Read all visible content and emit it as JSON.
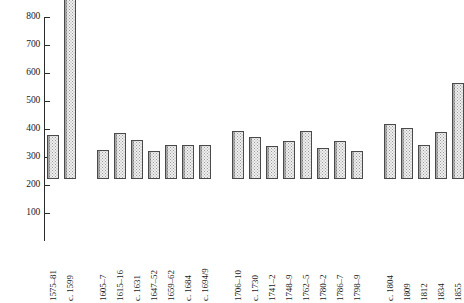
{
  "chart_data": {
    "type": "bar",
    "title": "",
    "subtitle": "",
    "xlabel": "",
    "ylabel": "",
    "ylim": [
      0,
      800
    ],
    "yticks": [
      100,
      200,
      300,
      400,
      500,
      600,
      700,
      800
    ],
    "ytick_labels": [
      "100",
      "200",
      "300",
      "400",
      "500",
      "600",
      "700",
      "800"
    ],
    "grid": false,
    "legend": null,
    "categories": [
      "1575–81",
      "c. 1599",
      "1605–7",
      "1615–16",
      "c. 1631",
      "1647–52",
      "1659–62",
      "c. 1684",
      "c. 1694/9",
      "1706–10",
      "c. 1730",
      "1741–2",
      "1748–9",
      "1762–5",
      "1780–2",
      "1786–7",
      "1798–9",
      "c. 1804",
      "1809",
      "1812",
      "1834",
      "1855"
    ],
    "values": [
      157,
      785,
      103,
      163,
      138,
      100,
      120,
      120,
      120,
      172,
      150,
      118,
      135,
      170,
      112,
      135,
      100,
      196,
      183,
      123,
      168,
      343
    ],
    "groups": [
      {
        "name": "group-1",
        "start": 0,
        "end": 1
      },
      {
        "name": "group-2",
        "start": 2,
        "end": 8
      },
      {
        "name": "group-3",
        "start": 9,
        "end": 16
      },
      {
        "name": "group-4",
        "start": 17,
        "end": 21
      }
    ],
    "colors": {
      "bar_fill": "#efefef",
      "bar_pattern": "#9a9a9a",
      "bar_border": "#4a4a4a",
      "axis": "#2b2b2b",
      "text": "#1a1a1a",
      "background": "#ffffff"
    },
    "layout": {
      "axis_x_px": 44,
      "baseline_y_px": 241,
      "top_y_px": 17,
      "bar_width_px": 12,
      "bar_gap_px": 5,
      "group_gap_px": 16,
      "first_bar_x_px": 47
    }
  }
}
